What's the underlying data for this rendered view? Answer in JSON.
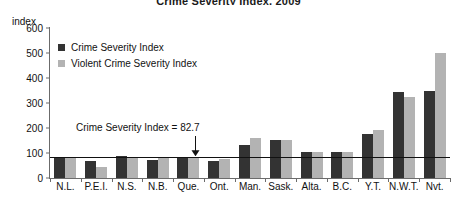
{
  "title": "Crime Severity Index, 2009",
  "axis_unit_label": "index",
  "legend": {
    "items": [
      {
        "label": "Crime Severity Index",
        "color": "#333333"
      },
      {
        "label": "Violent Crime Severity Index",
        "color": "#b3b3b3"
      }
    ]
  },
  "annotation": {
    "text": "Crime Severity Index = 82.7",
    "value": 82.7
  },
  "chart_data": {
    "type": "bar",
    "title": "Crime Severity Index, 2009",
    "xlabel": "",
    "ylabel": "index",
    "ylim": [
      0,
      600
    ],
    "yticks": [
      0,
      100,
      200,
      300,
      400,
      500,
      600
    ],
    "grid": false,
    "legend_position": "upper-left",
    "categories": [
      "N.L.",
      "P.E.I.",
      "N.S.",
      "N.B.",
      "Que.",
      "Ont.",
      "Man.",
      "Sask.",
      "Alta.",
      "B.C.",
      "Y.T.",
      "N.W.T.",
      "Nvt."
    ],
    "series": [
      {
        "name": "Crime Severity Index",
        "color": "#333333",
        "values": [
          80,
          68,
          90,
          72,
          82,
          69,
          131,
          151,
          105,
          105,
          175,
          345,
          348
        ]
      },
      {
        "name": "Violent Crime Severity Index",
        "color": "#b3b3b3",
        "values": [
          80,
          45,
          86,
          79,
          82,
          78,
          160,
          152,
          104,
          104,
          191,
          325,
          500
        ]
      }
    ],
    "reference_line": {
      "value": 82.7,
      "label": "Crime Severity Index = 82.7"
    }
  }
}
